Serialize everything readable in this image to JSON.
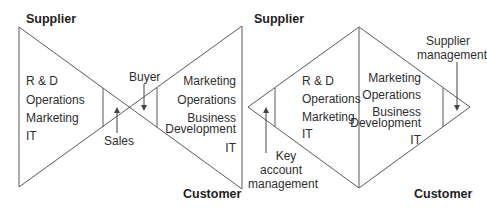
{
  "left_diagram": {
    "name": "bow-tie",
    "top_label": "Supplier",
    "bottom_label": "Customer",
    "supplier_functions": [
      "R & D",
      "Operations",
      "Marketing",
      "IT"
    ],
    "customer_functions": [
      "Marketing",
      "Operations",
      "Business",
      "Development",
      "IT"
    ],
    "sales_label": "Sales",
    "buyer_label": "Buyer"
  },
  "right_diagram": {
    "name": "diamond",
    "top_label": "Supplier",
    "bottom_label": "Customer",
    "supplier_functions": [
      "R & D",
      "Operations",
      "Marketing",
      "IT"
    ],
    "customer_functions": [
      "Marketing",
      "Operations",
      "Business",
      "Development",
      "IT"
    ],
    "key_account_label": [
      "Key",
      "account",
      "management"
    ],
    "supplier_mgmt_label": [
      "Supplier",
      "management"
    ]
  },
  "colors": {
    "line": "#555555",
    "text": "#2e2e2e"
  }
}
